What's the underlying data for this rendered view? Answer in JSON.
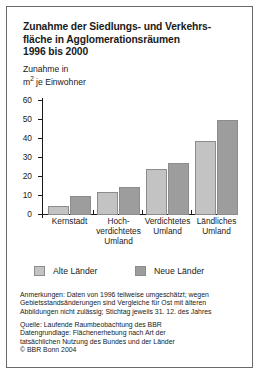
{
  "chart_data": {
    "type": "bar",
    "title_lines": [
      "Zunahme der Siedlungs- und Verkehrs-",
      "fläche in Agglomerationsräumen",
      "1996 bis 2000"
    ],
    "ylabel_lines": [
      "Zunahme in",
      "m² je Einwohner"
    ],
    "ylabel": "Zunahme in m² je Einwohner",
    "xlabel": "",
    "ylim": [
      0,
      60
    ],
    "yticks": [
      0,
      10,
      20,
      30,
      40,
      50,
      60
    ],
    "ytick_labels": [
      "0",
      "10",
      "20",
      "30",
      "40",
      "50",
      "60"
    ],
    "grid": false,
    "legend_position": "below-axis",
    "categories": [
      "Kernstadt",
      "Hoch-verdichtetes Umland",
      "Verdichtetes Umland",
      "Ländliches Umland"
    ],
    "category_lines": [
      [
        "Kernstadt"
      ],
      [
        "Hoch-",
        "verdichtetes",
        "Umland"
      ],
      [
        "Verdichtetes",
        "Umland"
      ],
      [
        "Ländliches",
        "Umland"
      ]
    ],
    "series": [
      {
        "name": "Alte Länder",
        "color": "#c3c3c3",
        "values": [
          4.5,
          12,
          24,
          39
        ]
      },
      {
        "name": "Neue Länder",
        "color": "#9d9d9d",
        "values": [
          10,
          14.5,
          27.5,
          50
        ]
      }
    ]
  },
  "notes": {
    "annotation_lines": [
      "Anmerkungen: Daten von 1996 teilweise umgeschätzt; wegen",
      "Gebietsstandsänderungen sind Vergleiche für Ost mit älteren",
      "Abbildungen nicht zulässig; Stichtag jeweils 31. 12. des Jahres"
    ],
    "source_lines": [
      "Quelle: Laufende Raumbeobachtung des BBR",
      "Datengrundlage: Flächenerhebung nach Art der",
      "tatsächlichen Nutzung des Bundes und der Länder",
      "© BBR Bonn 2004"
    ]
  },
  "colors": {
    "alte_laender": "#c3c3c3",
    "neue_laender": "#9d9d9d",
    "border": "#6a6a6a",
    "axis": "#1a1a1a"
  }
}
